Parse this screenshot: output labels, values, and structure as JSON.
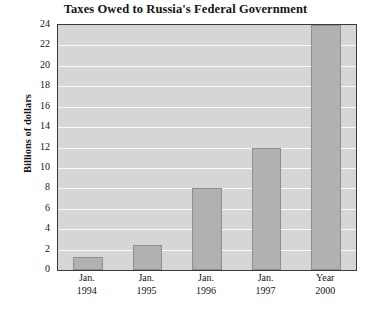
{
  "chart_data": {
    "type": "bar",
    "title": "Taxes Owed to Russia's Federal Government",
    "xlabel": "",
    "ylabel": "Billions of dollars",
    "categories": [
      "Jan. 1994",
      "Jan. 1995",
      "Jan. 1996",
      "Jan. 1997",
      "Year 2000"
    ],
    "category_lines": [
      {
        "line1": "Jan.",
        "line2": "1994"
      },
      {
        "line1": "Jan.",
        "line2": "1995"
      },
      {
        "line1": "Jan.",
        "line2": "1996"
      },
      {
        "line1": "Jan.",
        "line2": "1997"
      },
      {
        "line1": "Year",
        "line2": "2000"
      }
    ],
    "values": [
      1.3,
      2.5,
      8.0,
      12.0,
      24.0
    ],
    "ylim": [
      0,
      24
    ],
    "ytick_values": [
      0,
      2,
      4,
      6,
      8,
      10,
      12,
      14,
      16,
      18,
      20,
      22,
      24
    ],
    "ytick_labels": [
      "0",
      "2",
      "4",
      "6",
      "8",
      "10",
      "12",
      "14",
      "16",
      "18",
      "20",
      "22",
      "24"
    ],
    "grid": true,
    "legend": false,
    "colors": {
      "bar_fill": "#b1b1b1",
      "bar_edge": "#8f8f8f",
      "plot_background": "#d6d6d6",
      "gridline": "#fafafa",
      "axis_border": "#3a3a3a",
      "text": "#141414",
      "page_background": "#ffffff"
    }
  }
}
